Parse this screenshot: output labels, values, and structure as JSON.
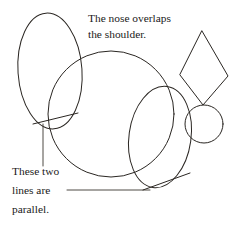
{
  "figure": {
    "background_color": "#ffffff",
    "ink_color": "#2a2622",
    "leader_color": "#3a3530",
    "width": 232,
    "height": 229
  },
  "annotations": {
    "top": {
      "name": "nose-overlaps-shoulder-note",
      "line1": "The nose overlaps",
      "line2": "the shoulder.",
      "x": 88,
      "y": 22
    },
    "bottom": {
      "name": "parallel-lines-note",
      "line1": "These two",
      "line2": "lines are",
      "line3": "parallel.",
      "x": 12,
      "y": 170
    }
  },
  "shapes": [
    {
      "name": "head-ellipse",
      "type": "ellipse",
      "cx": 50,
      "cy": 71,
      "rx": 32,
      "ry": 58,
      "rotation": -4
    },
    {
      "name": "body-circle",
      "type": "circle",
      "cx": 111,
      "cy": 114,
      "r": 63
    },
    {
      "name": "haunch-ellipse",
      "type": "ellipse",
      "cx": 160,
      "cy": 137,
      "rx": 31,
      "ry": 51,
      "rotation": 8
    },
    {
      "name": "muzzle-circle",
      "type": "circle",
      "cx": 204,
      "cy": 124,
      "r": 19
    },
    {
      "name": "ear-diamond",
      "type": "polygon",
      "points": "202,31 228,76 203,105 180,75"
    }
  ],
  "guide_lines": [
    {
      "name": "parallel-line-left",
      "x1": 33,
      "y1": 124,
      "x2": 78,
      "y2": 113
    },
    {
      "name": "parallel-line-right",
      "x1": 143,
      "y1": 190,
      "x2": 190,
      "y2": 173
    }
  ],
  "leaders": [
    {
      "name": "leader-vertical-to-left-line",
      "x1": 43,
      "y1": 124,
      "x2": 43,
      "y2": 166
    },
    {
      "name": "leader-horizontal-to-right-line",
      "x1": 67,
      "y1": 190,
      "x2": 150,
      "y2": 190
    }
  ]
}
